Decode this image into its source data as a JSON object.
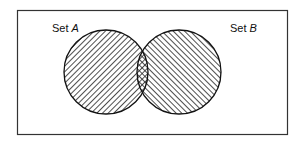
{
  "diagram": {
    "type": "venn",
    "sets": [
      {
        "id": "A",
        "label_prefix": "Set",
        "label_var": "A",
        "hatch": "forward-diagonal"
      },
      {
        "id": "B",
        "label_prefix": "Set",
        "label_var": "B",
        "hatch": "backward-diagonal"
      }
    ],
    "intersection": {
      "hatch": "crosshatch"
    },
    "colors": {
      "stroke": "#111111",
      "background": "#ffffff"
    }
  }
}
